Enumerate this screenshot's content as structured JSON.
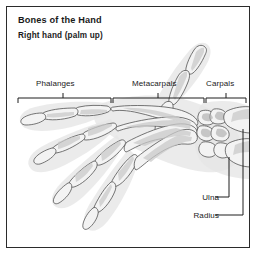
{
  "figure": {
    "title": "Bones of the Hand",
    "subtitle": "Right hand (palm up)",
    "frame_color": "#2b2b2b",
    "background_color": "#ffffff",
    "ink_color": "#1a1a1a",
    "illustration": {
      "subject": "skeletal hand",
      "view": "palmar (palm up)",
      "side": "right",
      "style": "grayscale pencil shaded anatomical drawing"
    }
  },
  "region_labels": [
    {
      "id": "phalanges",
      "label": "Phalanges",
      "bracket": {
        "x_start": 11,
        "x_end": 104,
        "y": 91,
        "tick_x": 56
      }
    },
    {
      "id": "metacarpals",
      "label": "Metacarpals",
      "bracket": {
        "x_start": 106,
        "x_end": 197,
        "y": 91,
        "tick_x": 151
      }
    },
    {
      "id": "carpals",
      "label": "Carpals",
      "bracket": {
        "x_start": 199,
        "x_end": 239,
        "y": 91,
        "tick_x": 219
      }
    }
  ],
  "side_labels": [
    {
      "id": "ulna",
      "label": "Ulna",
      "leader": {
        "x_start": 208,
        "y": 190,
        "x_corner": 222,
        "y_target": 150
      }
    },
    {
      "id": "radius",
      "label": "Radius",
      "leader": {
        "x_start": 208,
        "y": 208,
        "x_corner": 236,
        "y_target": 122
      }
    }
  ]
}
